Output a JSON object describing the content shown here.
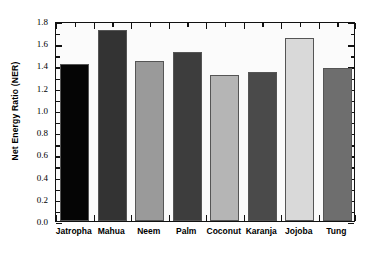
{
  "chart_data": {
    "type": "bar",
    "title": "",
    "xlabel": "",
    "ylabel": "Net Energy Ratio (NER)",
    "categories": [
      "Jatropha",
      "Mahua",
      "Neem",
      "Palm",
      "Coconut",
      "Karanja",
      "Jojoba",
      "Tung"
    ],
    "values": [
      1.41,
      1.72,
      1.44,
      1.52,
      1.31,
      1.34,
      1.65,
      1.38
    ],
    "bar_colors": [
      "#050505",
      "#333333",
      "#9a9a9a",
      "#3d3d3d",
      "#b5b5b5",
      "#4a4a4a",
      "#d9d9d9",
      "#6e6e6e"
    ],
    "ylim": [
      0.0,
      1.8
    ],
    "ytick_values": [
      0.0,
      0.2,
      0.4,
      0.6,
      0.8,
      1.0,
      1.2,
      1.4,
      1.6,
      1.8
    ],
    "ytick_labels": [
      "0.0",
      "0.2",
      "0.4",
      "0.6",
      "0.8",
      "1.0",
      "1.2",
      "1.4",
      "1.6",
      "1.8"
    ],
    "ytick_minor_step": 0.1,
    "grid": false,
    "legend": "none",
    "frame": "box",
    "ticks_direction": "in",
    "ticks_on": [
      "left",
      "right",
      "top",
      "bottom"
    ],
    "background": "#fbfbfb",
    "axis_color": "#111111"
  }
}
